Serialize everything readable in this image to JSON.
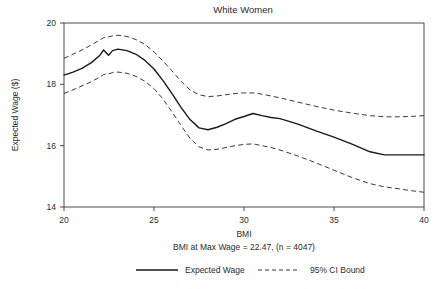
{
  "chart_data": {
    "type": "line",
    "title": "White Women",
    "xlabel": "BMI",
    "ylabel": "Expected Wage ($)",
    "caption": "BMI at Max Wage = 22.47, (n = 4047)",
    "xlim": [
      20,
      40
    ],
    "ylim": [
      14,
      20
    ],
    "xticks": [
      20,
      25,
      30,
      35,
      40
    ],
    "xtick_labels": [
      "20",
      "25",
      "30",
      "35",
      "40"
    ],
    "yticks": [
      14,
      16,
      18,
      20
    ],
    "ytick_labels": [
      "14",
      "16",
      "18",
      "20"
    ],
    "grid": false,
    "legend_position": "bottom",
    "legend": [
      {
        "name": "Expected Wage",
        "style": "solid"
      },
      {
        "name": "95% CI Bound",
        "style": "dashed"
      }
    ],
    "x": [
      20.0,
      20.5,
      21.0,
      21.5,
      22.0,
      22.2,
      22.47,
      22.7,
      23.0,
      23.5,
      24.0,
      24.5,
      25.0,
      25.5,
      26.0,
      26.5,
      27.0,
      27.5,
      28.0,
      28.5,
      29.0,
      29.5,
      30.0,
      30.5,
      31.0,
      31.5,
      32.0,
      33.0,
      34.0,
      35.0,
      36.0,
      37.0,
      37.8,
      38.5,
      39.2,
      40.0
    ],
    "series": [
      {
        "name": "Expected Wage",
        "style": "solid",
        "values": [
          18.3,
          18.4,
          18.52,
          18.7,
          18.95,
          19.12,
          18.95,
          19.1,
          19.15,
          19.1,
          18.98,
          18.78,
          18.5,
          18.12,
          17.7,
          17.25,
          16.85,
          16.58,
          16.52,
          16.6,
          16.72,
          16.86,
          16.95,
          17.05,
          16.98,
          16.92,
          16.88,
          16.7,
          16.48,
          16.28,
          16.05,
          15.8,
          15.7,
          15.7,
          15.7,
          15.7
        ]
      },
      {
        "name": "95% CI Upper Bound",
        "style": "dashed",
        "values": [
          18.85,
          18.98,
          19.12,
          19.28,
          19.45,
          19.52,
          19.55,
          19.58,
          19.6,
          19.56,
          19.46,
          19.3,
          19.06,
          18.76,
          18.44,
          18.1,
          17.82,
          17.66,
          17.6,
          17.62,
          17.66,
          17.7,
          17.72,
          17.72,
          17.68,
          17.62,
          17.56,
          17.42,
          17.28,
          17.16,
          17.06,
          16.98,
          16.94,
          16.94,
          16.95,
          16.98
        ]
      },
      {
        "name": "95% CI Lower Bound",
        "style": "dashed",
        "values": [
          17.7,
          17.82,
          17.95,
          18.08,
          18.24,
          18.32,
          18.34,
          18.38,
          18.4,
          18.36,
          18.26,
          18.1,
          17.86,
          17.52,
          17.1,
          16.66,
          16.24,
          15.96,
          15.86,
          15.88,
          15.94,
          16.0,
          16.04,
          16.06,
          16.0,
          15.94,
          15.86,
          15.66,
          15.44,
          15.2,
          14.96,
          14.76,
          14.66,
          14.6,
          14.54,
          14.48
        ]
      }
    ],
    "annotations": {
      "bmi_at_max_wage": "22.47",
      "n": "4047"
    },
    "colors": {
      "solid_line": "#1a1a1a",
      "dashed_line": "#3a3a3a",
      "frame": "#4a4a4a",
      "text": "#2b2b2b",
      "background": "#ffffff"
    }
  }
}
